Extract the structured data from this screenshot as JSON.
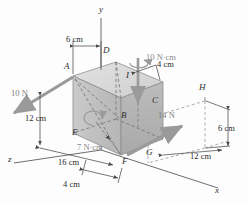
{
  "figure": {
    "kind": "statics-free-body-diagram",
    "background_color": "#fdfdfd"
  },
  "colors": {
    "box_top_face": "#d8d8d8",
    "box_front_face": "#c4c4c4",
    "box_right_face": "#b3b3b3",
    "box_edge": "#8d8d8d",
    "axis_line": "#6e6e6e",
    "dimension_line": "#4a4a4a",
    "force_arrow": "#9a9a9a",
    "moment_arrow": "#9a9a9a",
    "hidden_edge": "#7a7a7a",
    "text": "#2e2e2e"
  },
  "axes": [
    {
      "name": "y-axis",
      "label": "y"
    },
    {
      "name": "x-axis",
      "label": "x"
    },
    {
      "name": "z-axis",
      "label": "z"
    }
  ],
  "points": [
    {
      "name": "point-a",
      "label": "A"
    },
    {
      "name": "point-b",
      "label": "B"
    },
    {
      "name": "point-c",
      "label": "C"
    },
    {
      "name": "point-d",
      "label": "D"
    },
    {
      "name": "point-e",
      "label": "E"
    },
    {
      "name": "point-f",
      "label": "F"
    },
    {
      "name": "point-g",
      "label": "G"
    },
    {
      "name": "point-h",
      "label": "H"
    },
    {
      "name": "point-i",
      "label": "I"
    }
  ],
  "forces": [
    {
      "name": "force-10n",
      "label": "10 N",
      "magnitude": 10,
      "unit": "N"
    },
    {
      "name": "force-14n",
      "label": "14 N",
      "magnitude": 14,
      "unit": "N"
    }
  ],
  "moments": [
    {
      "name": "moment-10ncm",
      "label": "10 N·cm",
      "magnitude": 10,
      "unit": "N·cm"
    },
    {
      "name": "moment-7ncm",
      "label": "7 N·cm",
      "magnitude": 7,
      "unit": "N·cm"
    }
  ],
  "dimensions": [
    {
      "name": "dim-6cm-top",
      "label": "6 cm",
      "value": 6,
      "unit": "cm"
    },
    {
      "name": "dim-4cm-upper",
      "label": "4 cm",
      "value": 4,
      "unit": "cm"
    },
    {
      "name": "dim-12cm-left",
      "label": "12 cm",
      "value": 12,
      "unit": "cm"
    },
    {
      "name": "dim-16cm",
      "label": "16 cm",
      "value": 16,
      "unit": "cm"
    },
    {
      "name": "dim-4cm-lower",
      "label": "4 cm",
      "value": 4,
      "unit": "cm"
    },
    {
      "name": "dim-6cm-right",
      "label": "6 cm",
      "value": 6,
      "unit": "cm"
    },
    {
      "name": "dim-12cm-right",
      "label": "12 cm",
      "value": 12,
      "unit": "cm"
    }
  ]
}
